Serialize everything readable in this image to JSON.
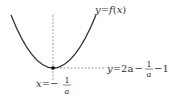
{
  "diagram": {
    "curve_label": "y = f(x)",
    "curve_label_parts": {
      "y": "y",
      "eq": "=",
      "f": "f",
      "lp": "(",
      "x": "x",
      "rp": ")"
    },
    "vertical_line_label": {
      "lhs": "x",
      "eq": "=",
      "neg": "−",
      "num": "1",
      "den": "a"
    },
    "horizontal_line_label": {
      "lhs": "y",
      "eq": "=",
      "term1": "2a",
      "minus1": "−",
      "num": "1",
      "den": "a",
      "minus2": "−",
      "const": "1"
    },
    "colors": {
      "curve": "#333333",
      "dashed": "#666666",
      "vertex": "#000000"
    }
  }
}
